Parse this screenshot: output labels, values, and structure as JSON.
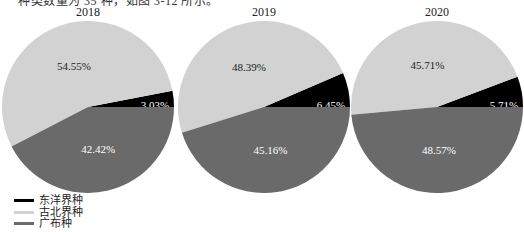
{
  "header": {
    "cut_off_text": "种类数量为 35 种，如图 3-12 所示。"
  },
  "chart_data": [
    {
      "type": "pie",
      "title": "2018",
      "categories": [
        "东洋界种",
        "古北界种",
        "广布种"
      ],
      "values": [
        3.03,
        54.55,
        42.42
      ],
      "labels": [
        "3.03%",
        "54.55%",
        "42.42%"
      ]
    },
    {
      "type": "pie",
      "title": "2019",
      "categories": [
        "东洋界种",
        "古北界种",
        "广布种"
      ],
      "values": [
        6.45,
        48.39,
        45.16
      ],
      "labels": [
        "6.45%",
        "48.39%",
        "45.16%"
      ]
    },
    {
      "type": "pie",
      "title": "2020",
      "categories": [
        "东洋界种",
        "古北界种",
        "广布种"
      ],
      "values": [
        5.71,
        45.71,
        48.57
      ],
      "labels": [
        "5.71%",
        "45.71%",
        "48.57%"
      ]
    }
  ],
  "legend": {
    "placement": "bottom-left",
    "items": [
      {
        "label": "东洋界种",
        "color": "#000000"
      },
      {
        "label": "古北界种",
        "color": "#d2d2d2"
      },
      {
        "label": "广布种",
        "color": "#6a6a6a"
      }
    ]
  },
  "label_colors": [
    "#ffffff",
    "#222222",
    "#ffffff"
  ]
}
